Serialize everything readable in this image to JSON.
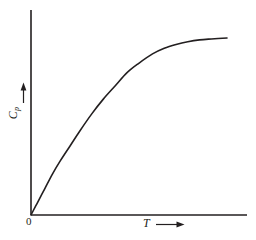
{
  "figure": {
    "background_color": "#ffffff",
    "ink_color": "#231f20",
    "width": 256,
    "height": 240
  },
  "labels": {
    "origin": "0",
    "x_axis_symbol": "T",
    "y_axis_symbol": "C",
    "y_axis_subscript": "p"
  },
  "chart_data": {
    "type": "line",
    "title": "",
    "subtitle": "",
    "xlabel": "T",
    "ylabel": "Cp",
    "xlim": [
      0,
      1
    ],
    "ylim": [
      0,
      1
    ],
    "grid": false,
    "legend": null,
    "legend_position": "none",
    "axis_style": {
      "x_axis": "solid line with arrow on label",
      "y_axis": "solid line with arrow on label",
      "ticks": "none",
      "tick_labels": [
        "0"
      ],
      "spines": [
        "left",
        "bottom"
      ]
    },
    "annotations": [
      {
        "text": "0",
        "x": 0,
        "y": 0,
        "note": "origin label below axis intersection"
      },
      {
        "text": "T →",
        "x": 0.55,
        "y": -0.05,
        "note": "x-axis label with rightward arrow"
      },
      {
        "text": "Cp ↑",
        "x": -0.09,
        "y": 0.52,
        "note": "y-axis label rotated 90deg with upward arrow"
      }
    ],
    "series": [
      {
        "name": "Heat capacity",
        "color": "#231f20",
        "line_width": 1.6,
        "x": [
          0.0,
          0.03,
          0.07,
          0.11,
          0.15,
          0.2,
          0.25,
          0.31,
          0.37,
          0.43,
          0.49,
          0.55,
          0.62,
          0.68,
          0.74,
          0.8,
          0.86,
          0.92,
          1.0
        ],
        "y": [
          0.0,
          0.06,
          0.14,
          0.22,
          0.29,
          0.37,
          0.45,
          0.54,
          0.62,
          0.69,
          0.76,
          0.81,
          0.86,
          0.89,
          0.91,
          0.925,
          0.935,
          0.94,
          0.945
        ]
      }
    ],
    "pixel_geometry": {
      "y_axis_x": 31,
      "y_axis_top_y": 10,
      "x_axis_y": 215,
      "x_axis_right_x": 247,
      "curve_start": [
        31,
        215
      ],
      "curve_end": [
        227,
        38
      ],
      "plateau_y": 38
    }
  }
}
